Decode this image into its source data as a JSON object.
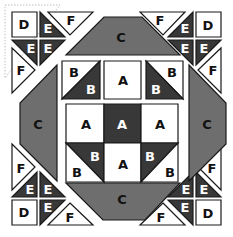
{
  "diagram": {
    "colors": {
      "background": "#ffffff",
      "light": "#ffffff",
      "medium": "#6e6e6e",
      "dark": "#383838",
      "outline": "#1a1a1a",
      "guide": "#bfbfbf",
      "label_on_light": "#111111",
      "label_on_dark": "#ffffff"
    },
    "guide_outline": [
      [
        5,
        5
      ],
      [
        60,
        5
      ],
      [
        5,
        78
      ]
    ],
    "pieces": [
      {
        "name": "corner-tl-d",
        "fill": "light",
        "points": [
          [
            12,
            12
          ],
          [
            37,
            12
          ],
          [
            37,
            37
          ],
          [
            12,
            37
          ]
        ],
        "label": "D",
        "lx": 24,
        "ly": 24,
        "lc": "dark_text"
      },
      {
        "name": "corner-tl-e1",
        "fill": "dark",
        "points": [
          [
            40,
            12
          ],
          [
            65,
            37
          ],
          [
            40,
            37
          ]
        ],
        "label": "E",
        "lx": 48,
        "ly": 28,
        "lc": "light_text"
      },
      {
        "name": "corner-tl-f-top",
        "fill": "light",
        "points": [
          [
            48,
            12
          ],
          [
            93,
            12
          ],
          [
            70,
            35
          ]
        ],
        "label": "F",
        "lx": 71,
        "ly": 20,
        "lc": "dark_text"
      },
      {
        "name": "corner-tl-e2",
        "fill": "dark",
        "points": [
          [
            12,
            40
          ],
          [
            37,
            40
          ],
          [
            37,
            65
          ]
        ],
        "label": "E",
        "lx": 31,
        "ly": 48,
        "lc": "light_text"
      },
      {
        "name": "corner-tl-e3",
        "fill": "dark",
        "points": [
          [
            40,
            40
          ],
          [
            65,
            40
          ],
          [
            40,
            65
          ]
        ],
        "label": "E",
        "lx": 48,
        "ly": 48,
        "lc": "light_text"
      },
      {
        "name": "corner-tl-f-left",
        "fill": "light",
        "points": [
          [
            12,
            48
          ],
          [
            35,
            70
          ],
          [
            12,
            93
          ]
        ],
        "label": "F",
        "lx": 21,
        "ly": 70,
        "lc": "dark_text"
      },
      {
        "name": "corner-tr-d",
        "fill": "light",
        "points": [
          [
            196,
            12
          ],
          [
            221,
            12
          ],
          [
            221,
            37
          ],
          [
            196,
            37
          ]
        ],
        "label": "D",
        "lx": 208,
        "ly": 25,
        "lc": "dark_text"
      },
      {
        "name": "corner-tr-e1",
        "fill": "dark",
        "points": [
          [
            193,
            12
          ],
          [
            193,
            37
          ],
          [
            168,
            37
          ]
        ],
        "label": "E",
        "lx": 185,
        "ly": 28,
        "lc": "light_text"
      },
      {
        "name": "corner-tr-f-top",
        "fill": "light",
        "points": [
          [
            140,
            12
          ],
          [
            185,
            12
          ],
          [
            163,
            35
          ]
        ],
        "label": "F",
        "lx": 160,
        "ly": 20,
        "lc": "dark_text"
      },
      {
        "name": "corner-tr-e2",
        "fill": "dark",
        "points": [
          [
            168,
            40
          ],
          [
            193,
            40
          ],
          [
            193,
            65
          ]
        ],
        "label": "E",
        "lx": 185,
        "ly": 48,
        "lc": "light_text"
      },
      {
        "name": "corner-tr-e3",
        "fill": "dark",
        "points": [
          [
            196,
            40
          ],
          [
            221,
            40
          ],
          [
            196,
            65
          ]
        ],
        "label": "E",
        "lx": 204,
        "ly": 48,
        "lc": "light_text"
      },
      {
        "name": "corner-tr-f-right",
        "fill": "light",
        "points": [
          [
            221,
            48
          ],
          [
            221,
            93
          ],
          [
            198,
            70
          ]
        ],
        "label": "F",
        "lx": 213,
        "ly": 70,
        "lc": "dark_text"
      },
      {
        "name": "corner-bl-d",
        "fill": "light",
        "points": [
          [
            12,
            200
          ],
          [
            37,
            200
          ],
          [
            37,
            225
          ],
          [
            12,
            225
          ]
        ],
        "label": "D",
        "lx": 24,
        "ly": 212,
        "lc": "dark_text"
      },
      {
        "name": "corner-bl-e1",
        "fill": "dark",
        "points": [
          [
            12,
            197
          ],
          [
            37,
            172
          ],
          [
            37,
            197
          ]
        ],
        "label": "E",
        "lx": 30,
        "ly": 189,
        "lc": "light_text"
      },
      {
        "name": "corner-bl-e2",
        "fill": "dark",
        "points": [
          [
            40,
            172
          ],
          [
            65,
            197
          ],
          [
            40,
            197
          ]
        ],
        "label": "E",
        "lx": 48,
        "ly": 189,
        "lc": "light_text"
      },
      {
        "name": "corner-bl-e3",
        "fill": "dark",
        "points": [
          [
            40,
            200
          ],
          [
            65,
            200
          ],
          [
            40,
            225
          ]
        ],
        "label": "E",
        "lx": 48,
        "ly": 207,
        "lc": "light_text"
      },
      {
        "name": "corner-bl-f-left",
        "fill": "light",
        "points": [
          [
            12,
            144
          ],
          [
            35,
            167
          ],
          [
            12,
            190
          ]
        ],
        "label": "F",
        "lx": 21,
        "ly": 168,
        "lc": "dark_text"
      },
      {
        "name": "corner-bl-f-bottom",
        "fill": "light",
        "points": [
          [
            70,
            203
          ],
          [
            93,
            225
          ],
          [
            48,
            225
          ]
        ],
        "label": "F",
        "lx": 70,
        "ly": 217,
        "lc": "dark_text"
      },
      {
        "name": "corner-br-d",
        "fill": "light",
        "points": [
          [
            196,
            200
          ],
          [
            221,
            200
          ],
          [
            221,
            225
          ],
          [
            196,
            225
          ]
        ],
        "label": "D",
        "lx": 208,
        "ly": 213,
        "lc": "dark_text"
      },
      {
        "name": "corner-br-e1",
        "fill": "dark",
        "points": [
          [
            196,
            172
          ],
          [
            221,
            197
          ],
          [
            196,
            197
          ]
        ],
        "label": "E",
        "lx": 204,
        "ly": 189,
        "lc": "light_text"
      },
      {
        "name": "corner-br-e2",
        "fill": "dark",
        "points": [
          [
            193,
            172
          ],
          [
            193,
            197
          ],
          [
            168,
            197
          ]
        ],
        "label": "E",
        "lx": 186,
        "ly": 189,
        "lc": "light_text"
      },
      {
        "name": "corner-br-e3",
        "fill": "dark",
        "points": [
          [
            168,
            200
          ],
          [
            193,
            200
          ],
          [
            193,
            225
          ]
        ],
        "label": "E",
        "lx": 185,
        "ly": 207,
        "lc": "light_text"
      },
      {
        "name": "corner-br-f-right",
        "fill": "light",
        "points": [
          [
            221,
            144
          ],
          [
            221,
            190
          ],
          [
            198,
            167
          ]
        ],
        "label": "F",
        "lx": 212,
        "ly": 168,
        "lc": "dark_text"
      },
      {
        "name": "corner-br-f-bottom",
        "fill": "light",
        "points": [
          [
            163,
            203
          ],
          [
            185,
            225
          ],
          [
            140,
            225
          ]
        ],
        "label": "F",
        "lx": 161,
        "ly": 217,
        "lc": "dark_text"
      },
      {
        "name": "c-top",
        "fill": "medium",
        "points": [
          [
            104,
            17
          ],
          [
            142,
            17
          ],
          [
            180,
            55
          ],
          [
            66,
            55
          ]
        ],
        "label": "C",
        "lx": 121,
        "ly": 37,
        "lc": "dark_text"
      },
      {
        "name": "c-bottom",
        "fill": "medium",
        "points": [
          [
            66,
            183
          ],
          [
            180,
            183
          ],
          [
            145,
            220
          ],
          [
            103,
            220
          ]
        ],
        "label": "C",
        "lx": 122,
        "ly": 199,
        "lc": "dark_text"
      },
      {
        "name": "c-left",
        "fill": "medium",
        "points": [
          [
            57,
            65
          ],
          [
            57,
            181
          ],
          [
            20,
            144
          ],
          [
            20,
            103
          ]
        ],
        "label": "C",
        "lx": 38,
        "ly": 124,
        "lc": "dark_text"
      },
      {
        "name": "c-right",
        "fill": "medium",
        "points": [
          [
            189,
            65
          ],
          [
            226,
            103
          ],
          [
            226,
            144
          ],
          [
            189,
            181
          ]
        ],
        "label": "C",
        "lx": 207,
        "ly": 124,
        "lc": "dark_text"
      },
      {
        "name": "top-left-b-light",
        "fill": "light",
        "points": [
          [
            62,
            61
          ],
          [
            100,
            61
          ],
          [
            62,
            99
          ]
        ],
        "label": "B",
        "lx": 74,
        "ly": 72,
        "lc": "dark_text"
      },
      {
        "name": "top-left-b-dark",
        "fill": "dark",
        "points": [
          [
            100,
            61
          ],
          [
            100,
            99
          ],
          [
            62,
            99
          ]
        ],
        "label": "B",
        "lx": 91,
        "ly": 89,
        "lc": "light_text"
      },
      {
        "name": "top-center-a",
        "fill": "light",
        "points": [
          [
            104,
            61
          ],
          [
            141,
            61
          ],
          [
            141,
            99
          ],
          [
            104,
            99
          ]
        ],
        "label": "A",
        "lx": 123,
        "ly": 80,
        "lc": "dark_text"
      },
      {
        "name": "top-right-b-light",
        "fill": "light",
        "points": [
          [
            146,
            61
          ],
          [
            183,
            61
          ],
          [
            183,
            99
          ]
        ],
        "label": "B",
        "lx": 172,
        "ly": 72,
        "lc": "dark_text"
      },
      {
        "name": "top-right-b-dark",
        "fill": "dark",
        "points": [
          [
            146,
            61
          ],
          [
            183,
            99
          ],
          [
            146,
            99
          ]
        ],
        "label": "B",
        "lx": 156,
        "ly": 89,
        "lc": "light_text"
      },
      {
        "name": "mid-left-a",
        "fill": "light",
        "points": [
          [
            66,
            104
          ],
          [
            104,
            104
          ],
          [
            104,
            143
          ],
          [
            66,
            143
          ]
        ],
        "label": "A",
        "lx": 86,
        "ly": 124,
        "lc": "dark_text"
      },
      {
        "name": "mid-center-a",
        "fill": "dark",
        "points": [
          [
            104,
            104
          ],
          [
            141,
            104
          ],
          [
            141,
            143
          ],
          [
            104,
            143
          ]
        ],
        "label": "A",
        "lx": 122,
        "ly": 124,
        "lc": "light_text"
      },
      {
        "name": "mid-right-a",
        "fill": "light",
        "points": [
          [
            141,
            104
          ],
          [
            178,
            104
          ],
          [
            178,
            143
          ],
          [
            141,
            143
          ]
        ],
        "label": "A",
        "lx": 160,
        "ly": 124,
        "lc": "dark_text"
      },
      {
        "name": "bottom-left-b-dark",
        "fill": "dark",
        "points": [
          [
            66,
            143
          ],
          [
            104,
            143
          ],
          [
            104,
            182
          ]
        ],
        "label": "B",
        "lx": 95,
        "ly": 156,
        "lc": "light_text"
      },
      {
        "name": "bottom-left-b-light",
        "fill": "light",
        "points": [
          [
            66,
            143
          ],
          [
            104,
            182
          ],
          [
            66,
            182
          ]
        ],
        "label": "B",
        "lx": 77,
        "ly": 172,
        "lc": "dark_text"
      },
      {
        "name": "bottom-center-a",
        "fill": "light",
        "points": [
          [
            104,
            143
          ],
          [
            141,
            143
          ],
          [
            141,
            182
          ],
          [
            104,
            182
          ]
        ],
        "label": "A",
        "lx": 123,
        "ly": 164,
        "lc": "dark_text"
      },
      {
        "name": "bottom-right-b-dark",
        "fill": "dark",
        "points": [
          [
            141,
            143
          ],
          [
            178,
            143
          ],
          [
            141,
            182
          ]
        ],
        "label": "B",
        "lx": 150,
        "ly": 156,
        "lc": "light_text"
      },
      {
        "name": "bottom-right-b-light",
        "fill": "light",
        "points": [
          [
            178,
            143
          ],
          [
            178,
            182
          ],
          [
            141,
            182
          ]
        ],
        "label": "B",
        "lx": 170,
        "ly": 172,
        "lc": "dark_text"
      }
    ]
  }
}
